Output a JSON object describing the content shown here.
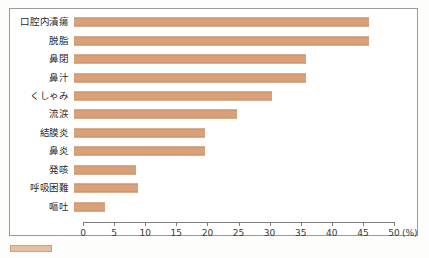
{
  "chart_data": {
    "type": "bar",
    "orientation": "horizontal",
    "title": "",
    "xlabel": "(%)",
    "ylabel": "",
    "xlim": [
      0,
      50
    ],
    "xticks": [
      0,
      5,
      10,
      15,
      20,
      25,
      30,
      35,
      40,
      45,
      50
    ],
    "xtick_labels": [
      "0",
      "5",
      "10",
      "15",
      "20",
      "25",
      "30",
      "35",
      "40",
      "45",
      "50"
    ],
    "unit": "(%)",
    "grid": false,
    "legend": null,
    "bar_color": "#d8a179",
    "bar_edge_color": "#c98d63",
    "categories": [
      "口腔内潰瘍",
      "脱脂",
      "鼻閉",
      "鼻汁",
      "くしゃみ",
      "流涙",
      "結膜炎",
      "鼻炎",
      "発咳",
      "呼吸困難",
      "嘔吐"
    ],
    "values": [
      47.5,
      47.5,
      37.3,
      37.3,
      31.8,
      26.2,
      21.0,
      21.0,
      10.0,
      10.3,
      5.0
    ]
  },
  "axis": {
    "unit_label": "(%)"
  }
}
